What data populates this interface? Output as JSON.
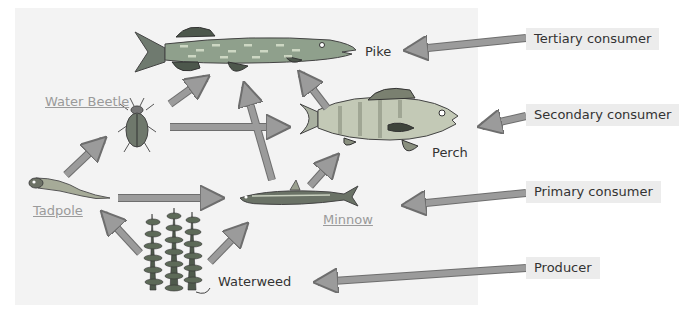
{
  "diagram": {
    "type": "food-web",
    "organisms": [
      {
        "id": "pike",
        "label": "Pike",
        "underlined": false
      },
      {
        "id": "perch",
        "label": "Perch",
        "underlined": false
      },
      {
        "id": "water_beetle",
        "label": "Water Beetle",
        "underlined": true
      },
      {
        "id": "tadpole",
        "label": "Tadpole",
        "underlined": true
      },
      {
        "id": "minnow",
        "label": "Minnow",
        "underlined": true
      },
      {
        "id": "waterweed",
        "label": "Waterweed",
        "underlined": false
      }
    ],
    "trophic_labels": [
      {
        "label": "Tertiary consumer",
        "points_to": "pike"
      },
      {
        "label": "Secondary consumer",
        "points_to": "perch"
      },
      {
        "label": "Primary consumer",
        "points_to": "minnow"
      },
      {
        "label": "Producer",
        "points_to": "waterweed"
      }
    ],
    "energy_flow": [
      {
        "from": "waterweed",
        "to": "tadpole"
      },
      {
        "from": "waterweed",
        "to": "minnow"
      },
      {
        "from": "tadpole",
        "to": "water_beetle"
      },
      {
        "from": "tadpole",
        "to": "minnow"
      },
      {
        "from": "water_beetle",
        "to": "pike"
      },
      {
        "from": "water_beetle",
        "to": "perch"
      },
      {
        "from": "minnow",
        "to": "pike"
      },
      {
        "from": "minnow",
        "to": "perch"
      },
      {
        "from": "perch",
        "to": "pike"
      }
    ],
    "colors": {
      "arrow_fill": "#9b9b9b",
      "arrow_stroke": "#6e6e6e",
      "panel_bg": "#f3f3f3",
      "tag_bg": "#ececec",
      "underlined_label": "#9a9a9a"
    }
  }
}
